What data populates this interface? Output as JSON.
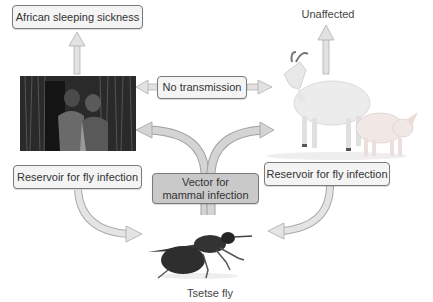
{
  "diagram": {
    "nodes": {
      "human_outcome": "African sleeping sickness",
      "animal_outcome": "Unaffected",
      "center_link": "No transmission",
      "human_role": "Reservoir for fly infection",
      "animal_role": "Reservoir for fly infection",
      "vector_role_line1": "Vector for",
      "vector_role_line2": "mammal infection",
      "vector": "Tsetse fly"
    },
    "images": {
      "humans": "photo of two children",
      "animals": "photo of goat and pig",
      "fly": "photo of tsetse fly"
    },
    "colors": {
      "box_fill": "#f4f4f4",
      "box_fill_dark": "#c9c9c9",
      "box_border": "#7a7a7a",
      "arrow_fill": "#d9d9d9",
      "arrow_stroke": "#9a9a9a"
    }
  }
}
